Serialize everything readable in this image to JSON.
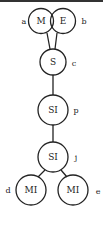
{
  "diagram": {
    "nodes": [
      {
        "id": "a",
        "label": "M",
        "tag": "a"
      },
      {
        "id": "b",
        "label": "E",
        "tag": "b"
      },
      {
        "id": "c",
        "label": "S",
        "tag": "c"
      },
      {
        "id": "p",
        "label": "SI",
        "tag": "p"
      },
      {
        "id": "j",
        "label": "SI",
        "tag": "j"
      },
      {
        "id": "d",
        "label": "MI",
        "tag": "d"
      },
      {
        "id": "e",
        "label": "MI",
        "tag": "e"
      }
    ],
    "edges": [
      [
        "a",
        "c"
      ],
      [
        "b",
        "c"
      ],
      [
        "c",
        "p"
      ],
      [
        "p",
        "j"
      ],
      [
        "j",
        "d"
      ],
      [
        "j",
        "e"
      ]
    ]
  }
}
